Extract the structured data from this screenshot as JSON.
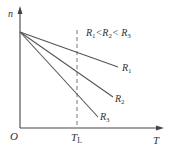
{
  "diagram": {
    "type": "line-graph-schematic",
    "axes": {
      "y_label": "n",
      "x_label": "T",
      "origin_label": "O"
    },
    "annotation": {
      "condition_parts": [
        "R",
        "1",
        "<R",
        "2",
        "< R",
        "3"
      ],
      "condition_text": "R1<R2<R3"
    },
    "vertical_marker": {
      "label_main": "T",
      "label_sub": "L",
      "style": "dashed"
    },
    "lines": [
      {
        "name": "R1",
        "label_main": "R",
        "label_sub": "1",
        "slope_rank": "shallowest"
      },
      {
        "name": "R2",
        "label_main": "R",
        "label_sub": "2",
        "slope_rank": "medium"
      },
      {
        "name": "R3",
        "label_main": "R",
        "label_sub": "3",
        "slope_rank": "steepest"
      }
    ],
    "colors": {
      "axis": "#444444",
      "lines": "#555555",
      "dashed": "#777777",
      "text": "#333333"
    }
  }
}
